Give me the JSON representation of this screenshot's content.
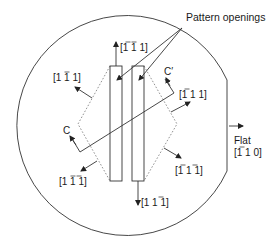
{
  "diagram": {
    "title_label": "Pattern openings",
    "flat_label": "Flat",
    "flat_direction": "[110]",
    "directions": {
      "up": {
        "text": "[111]",
        "bars": [
          true,
          true,
          false
        ]
      },
      "down": {
        "text": "[111]",
        "bars": [
          false,
          false,
          true
        ]
      },
      "upper_left": {
        "text": "[111]",
        "bars": [
          false,
          true,
          false
        ]
      },
      "upper_right": {
        "text": "[111]",
        "bars": [
          true,
          false,
          false
        ]
      },
      "lower_left": {
        "text": "[111]",
        "bars": [
          false,
          true,
          true
        ]
      },
      "lower_right": {
        "text": "[111]",
        "bars": [
          true,
          false,
          true
        ]
      },
      "flat": {
        "text": "[110]",
        "bars": [
          true,
          false,
          false
        ]
      }
    },
    "section_labels": {
      "c": "C",
      "c_prime": "C′"
    },
    "colors": {
      "line": "#333333",
      "dashed": "#777777",
      "background": "#ffffff"
    }
  }
}
